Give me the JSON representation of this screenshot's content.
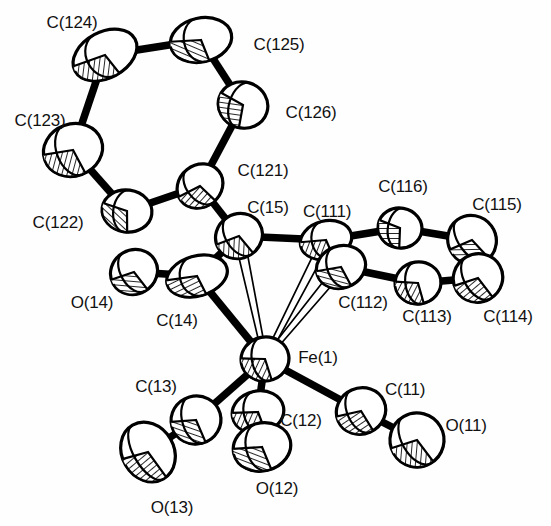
{
  "figure": {
    "kind": "ortep-thermal-ellipsoid-plot",
    "title": "",
    "background_color": "#ffffff",
    "line_color": "#000000",
    "fill_color": "#ffffff",
    "hatch_color": "#000000",
    "label_color": "#111111",
    "label_font_size_px": 17,
    "width": 551,
    "height": 526
  },
  "structure": {
    "central_metal": "Fe(1)",
    "ligand_groups": [
      "three terminal carbonyls: C(11)-O(11), C(12)-O(12), C(13)-O(13)",
      "acyl/carbonyl C(14)-O(14)",
      "eta-bonded carbon C(15)",
      "phenyl ring A: C(121)-C(122)-C(123)-C(124)-C(125)-C(126)",
      "phenyl ring B: C(111)-C(112)-C(113)-C(114)-C(115)-C(116)"
    ]
  },
  "atoms": [
    {
      "id": "C124",
      "label": "C(124)",
      "cx": 105,
      "cy": 55,
      "rx": 34,
      "ry": 23,
      "rot": -28,
      "label_x": 72,
      "label_y": 22,
      "kind": "carbon"
    },
    {
      "id": "C125",
      "label": "C(125)",
      "cx": 201,
      "cy": 40,
      "rx": 31,
      "ry": 22,
      "rot": -12,
      "label_x": 279,
      "label_y": 44,
      "kind": "carbon"
    },
    {
      "id": "C126",
      "label": "C(126)",
      "cx": 243,
      "cy": 105,
      "rx": 25,
      "ry": 23,
      "rot": 18,
      "label_x": 311,
      "label_y": 112,
      "kind": "carbon"
    },
    {
      "id": "C123",
      "label": "C(123)",
      "cx": 73,
      "cy": 150,
      "rx": 30,
      "ry": 26,
      "rot": -20,
      "label_x": 40,
      "label_y": 120,
      "kind": "carbon"
    },
    {
      "id": "C122",
      "label": "C(122)",
      "cx": 127,
      "cy": 211,
      "rx": 25,
      "ry": 21,
      "rot": 8,
      "label_x": 58,
      "label_y": 222,
      "kind": "carbon"
    },
    {
      "id": "C121",
      "label": "C(121)",
      "cx": 200,
      "cy": 186,
      "rx": 24,
      "ry": 21,
      "rot": -38,
      "label_x": 263,
      "label_y": 170,
      "kind": "carbon"
    },
    {
      "id": "C15",
      "label": "C(15)",
      "cx": 239,
      "cy": 236,
      "rx": 24,
      "ry": 22,
      "rot": -32,
      "label_x": 268,
      "label_y": 207,
      "kind": "carbon"
    },
    {
      "id": "O14",
      "label": "O(14)",
      "cx": 134,
      "cy": 272,
      "rx": 24,
      "ry": 22,
      "rot": -30,
      "label_x": 92,
      "label_y": 302,
      "kind": "oxygen"
    },
    {
      "id": "C14",
      "label": "C(14)",
      "cx": 197,
      "cy": 276,
      "rx": 31,
      "ry": 20,
      "rot": -16,
      "label_x": 177,
      "label_y": 320,
      "kind": "carbon"
    },
    {
      "id": "C111",
      "label": "C(111)",
      "cx": 326,
      "cy": 240,
      "rx": 26,
      "ry": 19,
      "rot": -14,
      "label_x": 327,
      "label_y": 211,
      "kind": "carbon"
    },
    {
      "id": "C112",
      "label": "C(112)",
      "cx": 341,
      "cy": 267,
      "rx": 25,
      "ry": 21,
      "rot": -20,
      "label_x": 363,
      "label_y": 302,
      "kind": "carbon"
    },
    {
      "id": "C116",
      "label": "C(116)",
      "cx": 400,
      "cy": 228,
      "rx": 22,
      "ry": 20,
      "rot": 10,
      "label_x": 403,
      "label_y": 186,
      "kind": "carbon"
    },
    {
      "id": "C113",
      "label": "C(113)",
      "cx": 418,
      "cy": 283,
      "rx": 23,
      "ry": 21,
      "rot": -8,
      "label_x": 427,
      "label_y": 316,
      "kind": "carbon"
    },
    {
      "id": "C115",
      "label": "C(115)",
      "cx": 472,
      "cy": 240,
      "rx": 24,
      "ry": 25,
      "rot": -36,
      "label_x": 497,
      "label_y": 204,
      "kind": "carbon"
    },
    {
      "id": "C114",
      "label": "C(114)",
      "cx": 478,
      "cy": 278,
      "rx": 25,
      "ry": 24,
      "rot": -30,
      "label_x": 508,
      "label_y": 316,
      "kind": "carbon"
    },
    {
      "id": "Fe1",
      "label": "Fe(1)",
      "cx": 265,
      "cy": 359,
      "rx": 24,
      "ry": 22,
      "rot": -10,
      "label_x": 318,
      "label_y": 357,
      "kind": "iron"
    },
    {
      "id": "C13",
      "label": "C(13)",
      "cx": 196,
      "cy": 420,
      "rx": 25,
      "ry": 24,
      "rot": -16,
      "label_x": 156,
      "label_y": 386,
      "kind": "carbon"
    },
    {
      "id": "O13",
      "label": "O(13)",
      "cx": 148,
      "cy": 452,
      "rx": 26,
      "ry": 31,
      "rot": -30,
      "label_x": 172,
      "label_y": 507,
      "kind": "oxygen"
    },
    {
      "id": "C12",
      "label": "C(12)",
      "cx": 258,
      "cy": 412,
      "rx": 26,
      "ry": 21,
      "rot": -12,
      "label_x": 301,
      "label_y": 420,
      "kind": "carbon"
    },
    {
      "id": "O12",
      "label": "O(12)",
      "cx": 262,
      "cy": 447,
      "rx": 29,
      "ry": 24,
      "rot": -14,
      "label_x": 277,
      "label_y": 488,
      "kind": "oxygen"
    },
    {
      "id": "C11",
      "label": "C(11)",
      "cx": 361,
      "cy": 411,
      "rx": 25,
      "ry": 23,
      "rot": -24,
      "label_x": 405,
      "label_y": 389,
      "kind": "carbon"
    },
    {
      "id": "O11",
      "label": "O(11)",
      "cx": 417,
      "cy": 440,
      "rx": 27,
      "ry": 27,
      "rot": -30,
      "label_x": 466,
      "label_y": 425,
      "kind": "oxygen"
    }
  ],
  "bonds": [
    {
      "from": "C124",
      "to": "C125",
      "style": "solid"
    },
    {
      "from": "C125",
      "to": "C126",
      "style": "solid"
    },
    {
      "from": "C126",
      "to": "C121",
      "style": "solid"
    },
    {
      "from": "C121",
      "to": "C122",
      "style": "solid"
    },
    {
      "from": "C122",
      "to": "C123",
      "style": "solid"
    },
    {
      "from": "C123",
      "to": "C124",
      "style": "solid"
    },
    {
      "from": "C121",
      "to": "C15",
      "style": "solid"
    },
    {
      "from": "C15",
      "to": "C14",
      "style": "solid"
    },
    {
      "from": "C14",
      "to": "O14",
      "style": "solid"
    },
    {
      "from": "C14",
      "to": "Fe1",
      "style": "solid"
    },
    {
      "from": "C15",
      "to": "C111",
      "style": "solid"
    },
    {
      "from": "C111",
      "to": "C116",
      "style": "solid"
    },
    {
      "from": "C116",
      "to": "C115",
      "style": "solid"
    },
    {
      "from": "C115",
      "to": "C114",
      "style": "solid"
    },
    {
      "from": "C114",
      "to": "C113",
      "style": "solid"
    },
    {
      "from": "C113",
      "to": "C112",
      "style": "solid"
    },
    {
      "from": "C112",
      "to": "C111",
      "style": "solid"
    },
    {
      "from": "Fe1",
      "to": "C13",
      "style": "solid"
    },
    {
      "from": "C13",
      "to": "O13",
      "style": "solid"
    },
    {
      "from": "Fe1",
      "to": "C12",
      "style": "solid"
    },
    {
      "from": "C12",
      "to": "O12",
      "style": "solid"
    },
    {
      "from": "Fe1",
      "to": "C11",
      "style": "solid"
    },
    {
      "from": "C11",
      "to": "O11",
      "style": "solid"
    },
    {
      "from": "Fe1",
      "to": "C15",
      "style": "open"
    },
    {
      "from": "Fe1",
      "to": "C111",
      "style": "open"
    },
    {
      "from": "Fe1",
      "to": "C112",
      "style": "open"
    }
  ]
}
